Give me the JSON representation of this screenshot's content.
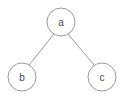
{
  "diagram": {
    "type": "tree",
    "nodes": [
      {
        "id": "a",
        "label": "a",
        "cx": 61,
        "cy": 22,
        "r": 14
      },
      {
        "id": "b",
        "label": "b",
        "cx": 22,
        "cy": 77,
        "r": 14
      },
      {
        "id": "c",
        "label": "c",
        "cx": 102,
        "cy": 77,
        "r": 14
      }
    ],
    "edges": [
      {
        "from": "a",
        "to": "b"
      },
      {
        "from": "a",
        "to": "c"
      }
    ]
  }
}
